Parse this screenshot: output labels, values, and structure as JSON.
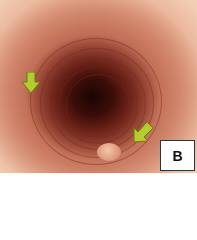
{
  "image": {
    "description": "Endoscopic view of esophageal lumen with concentric rings, two yellow-green arrows indicating mucosal lesions",
    "panel_label": "B",
    "arrows": [
      {
        "name": "arrow-left",
        "direction": "down",
        "color": "#b5cc2e"
      },
      {
        "name": "arrow-right",
        "direction": "down-left",
        "color": "#b5cc2e"
      }
    ]
  }
}
